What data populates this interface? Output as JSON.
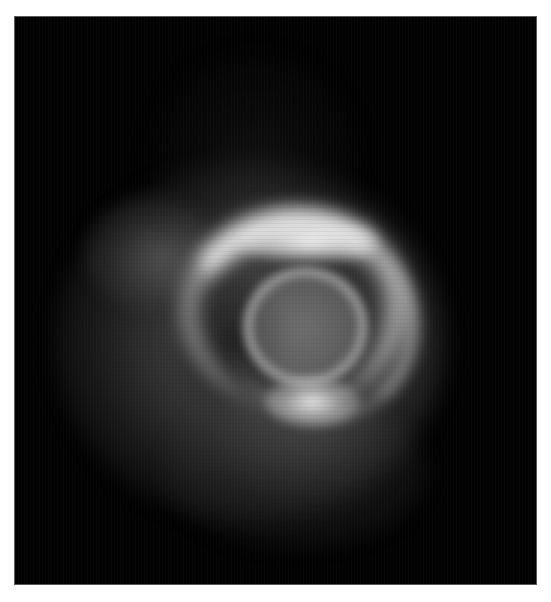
{
  "image": {
    "description": "Grayscale image of a luminous swirling spiral structure on a black background",
    "background_color": "#ffffff",
    "frame_color": "#020202",
    "border_color": "#5a5a5a",
    "features": [
      {
        "name": "outer-halo",
        "tone": "diffuse gray"
      },
      {
        "name": "bright-top-arc",
        "tone": "near white"
      },
      {
        "name": "inner-ring",
        "tone": "mid gray"
      },
      {
        "name": "bright-bottom-blob",
        "tone": "near white"
      },
      {
        "name": "upper-left-wing",
        "tone": "dim gray"
      }
    ]
  }
}
